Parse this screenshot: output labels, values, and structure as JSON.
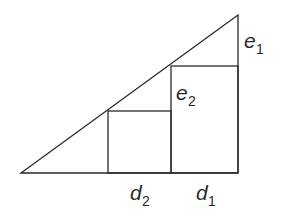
{
  "diagram": {
    "type": "right-triangle-with-inscribed-rectangles",
    "labels": {
      "e1": {
        "base": "e",
        "sub": "1"
      },
      "e2": {
        "base": "e",
        "sub": "2"
      },
      "d1": {
        "base": "d",
        "sub": "1"
      },
      "d2": {
        "base": "d",
        "sub": "2"
      }
    },
    "colors": {
      "stroke": "#2a2a2a",
      "background": "#ffffff"
    }
  }
}
